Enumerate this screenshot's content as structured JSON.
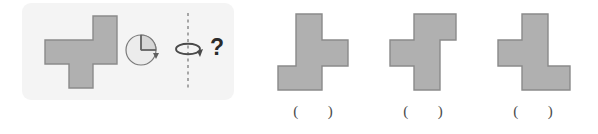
{
  "page": {
    "kind": "mental-rotation-multiple-choice",
    "background_color": "#ffffff"
  },
  "question": {
    "panel_color": "#f4f4f4",
    "prompt_symbol": "?",
    "stimulus": {
      "name": "cross-polyomino",
      "fill_color": "#b0b0b0",
      "stroke_color": "#8a8a8a",
      "cells": [
        [
          0,
          1
        ],
        [
          1,
          1
        ],
        [
          2,
          1
        ],
        [
          2,
          0
        ],
        [
          1,
          2
        ]
      ],
      "grid_cols": 3,
      "grid_rows": 3
    },
    "rotation_icon": {
      "name": "quarter-turn-pie-icon",
      "fill_color": "#d9d9d9",
      "stroke_color": "#6f6f6f",
      "description": "circle with quarter sector and clockwise arrow"
    },
    "axis_icon": {
      "name": "vertical-flip-axis-icon",
      "stroke_color": "#6f6f6f",
      "dash_color": "#8a8a8a",
      "description": "dashed vertical axis with curved rotation arrow"
    }
  },
  "options": [
    {
      "id": "option-a",
      "blank": "(    )",
      "shape": {
        "name": "t-polyomino-right",
        "fill_color": "#b0b0b0",
        "stroke_color": "#8a8a8a",
        "cells": [
          [
            1,
            0
          ],
          [
            1,
            1
          ],
          [
            1,
            2
          ],
          [
            2,
            1
          ],
          [
            0,
            2
          ]
        ],
        "grid_cols": 3,
        "grid_rows": 3
      }
    },
    {
      "id": "option-b",
      "blank": "(    )",
      "shape": {
        "name": "t-polyomino-left",
        "fill_color": "#b0b0b0",
        "stroke_color": "#8a8a8a",
        "cells": [
          [
            1,
            0
          ],
          [
            2,
            0
          ],
          [
            0,
            1
          ],
          [
            1,
            1
          ],
          [
            1,
            2
          ]
        ],
        "grid_cols": 3,
        "grid_rows": 3
      }
    },
    {
      "id": "option-c",
      "blank": "(    )",
      "shape": {
        "name": "t-polyomino-left-bottom-right",
        "fill_color": "#b0b0b0",
        "stroke_color": "#8a8a8a",
        "cells": [
          [
            1,
            0
          ],
          [
            0,
            1
          ],
          [
            1,
            1
          ],
          [
            1,
            2
          ],
          [
            2,
            2
          ]
        ],
        "grid_cols": 3,
        "grid_rows": 3
      }
    }
  ]
}
